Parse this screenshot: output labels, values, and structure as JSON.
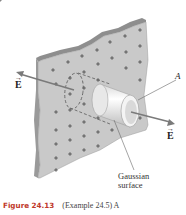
{
  "figure": {
    "labels": {
      "e_left": "E",
      "e_right": "E",
      "vector_arrow": "→",
      "area": "A",
      "gaussian_line1": "Gaussian",
      "gaussian_line2": "surface"
    },
    "charge_symbol": "+",
    "colors": {
      "plate_face": "#c9c9c9",
      "plate_edge": "#8e8e8e",
      "cylinder": "#f2f2f2",
      "arrow": "#7a7a7a",
      "charge": "#444444"
    }
  },
  "caption": {
    "number": "Figure 24.13",
    "text": "(Example 24.5) A"
  }
}
